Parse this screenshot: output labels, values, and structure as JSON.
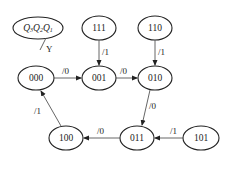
{
  "legend": {
    "state_label": "Q3Q2Q1",
    "q3": "Q",
    "q3_sub": "3",
    "q2": "Q",
    "q2_sub": "2",
    "q1": "Q",
    "q1_sub": "1",
    "output_label": "Y"
  },
  "states": {
    "s000": "000",
    "s001": "001",
    "s010": "010",
    "s011": "011",
    "s100": "100",
    "s101": "101",
    "s110": "110",
    "s111": "111"
  },
  "transitions": {
    "t000_001": "/0",
    "t001_010": "/0",
    "t010_011": "/0",
    "t011_100": "/0",
    "t100_000": "/1",
    "t111_001": "/1",
    "t110_010": "/1",
    "t101_011": "/1"
  }
}
